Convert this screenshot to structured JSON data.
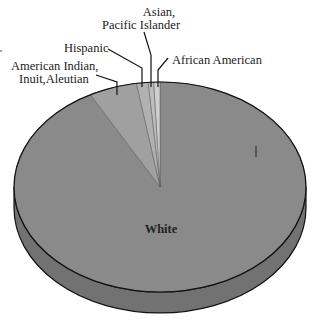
{
  "chart_data": {
    "type": "pie",
    "style": "3d",
    "title": "",
    "categories": [
      "White",
      "American Indian, Inuit,Aleutian",
      "Hispanic",
      "Asian, Pacific Islander",
      "African American"
    ],
    "values": [
      92.1,
      5.3,
      1.3,
      0.6,
      0.7
    ],
    "unit": "percent (estimated from slice angles)",
    "colors": [
      "#8a8a8a",
      "#a0a0a0",
      "#b1b1b1",
      "#bebebe",
      "#cfcfcf"
    ],
    "labels": {
      "white": "White",
      "american_indian_line1": "American Indian,",
      "american_indian_line2": "Inuit,Aleutian",
      "hispanic": "Hispanic",
      "asian_line1": "Asian,",
      "asian_line2": "Pacific Islander",
      "african_american": "African American"
    },
    "legend": "none (callout labels)",
    "side_color": "#727272",
    "edge_color": "#111111"
  }
}
